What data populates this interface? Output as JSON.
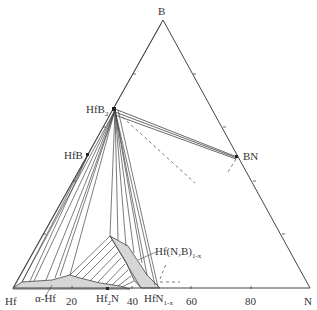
{
  "diagram": {
    "type": "ternary-phase-diagram",
    "vertices": {
      "top": "B",
      "left": "Hf",
      "right": "N"
    },
    "phases": {
      "hfb2": {
        "main": "HfB",
        "sub": "2"
      },
      "hfb": "HfB",
      "bn": "BN",
      "hf2n": {
        "main": "Hf",
        "sub": "2",
        "tail": "N"
      },
      "hfn": {
        "main": "HfN",
        "sub": "1-x"
      },
      "alpha_hf": "α-Hf",
      "solid_solution": {
        "main": "Hf(N,B)",
        "sub": "1-x"
      }
    },
    "axis_ticks": [
      "20",
      "40",
      "60",
      "80"
    ],
    "colors": {
      "line": "#444444",
      "fill": "#d6d6d6",
      "dash": "#555555"
    }
  }
}
